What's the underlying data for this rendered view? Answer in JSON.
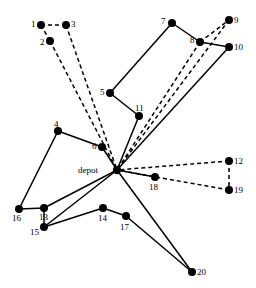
{
  "figure": {
    "kind": "vehicle-routing-network-diagram",
    "width": 256,
    "height": 288,
    "background_color": "#ffffff",
    "edge_color": "#000000",
    "node_color": "#000000",
    "label_color": "#000000"
  },
  "depot": {
    "id": "depot",
    "label": "depot",
    "x": 117,
    "y": 170,
    "radius": 4.2,
    "label_x": 78,
    "label_y": 166
  },
  "nodes": [
    {
      "id": 1,
      "label": "1",
      "x": 41,
      "y": 25,
      "label_x": 31,
      "label_y": 20
    },
    {
      "id": 2,
      "label": "2",
      "x": 50,
      "y": 41,
      "label_x": 40,
      "label_y": 38
    },
    {
      "id": 3,
      "label": "3",
      "x": 66,
      "y": 25,
      "label_x": 71,
      "label_y": 20
    },
    {
      "id": 4,
      "label": "4",
      "x": 58,
      "y": 131,
      "label_x": 54,
      "label_y": 120
    },
    {
      "id": 5,
      "label": "5",
      "x": 110,
      "y": 93,
      "label_x": 100,
      "label_y": 88
    },
    {
      "id": 6,
      "label": "6",
      "x": 102,
      "y": 147,
      "label_x": 92,
      "label_y": 142
    },
    {
      "id": 7,
      "label": "7",
      "x": 172,
      "y": 23,
      "label_x": 161,
      "label_y": 17
    },
    {
      "id": 8,
      "label": "8",
      "x": 200,
      "y": 42,
      "label_x": 190,
      "label_y": 36
    },
    {
      "id": 9,
      "label": "9",
      "x": 229,
      "y": 20,
      "label_x": 234,
      "label_y": 16
    },
    {
      "id": 10,
      "label": "10",
      "x": 229,
      "y": 47,
      "label_x": 234,
      "label_y": 43
    },
    {
      "id": 11,
      "label": "11",
      "x": 139,
      "y": 116,
      "label_x": 135,
      "label_y": 104
    },
    {
      "id": 12,
      "label": "12",
      "x": 229,
      "y": 161,
      "label_x": 234,
      "label_y": 157
    },
    {
      "id": 13,
      "label": "13",
      "x": 44,
      "y": 208,
      "label_x": 39,
      "label_y": 213
    },
    {
      "id": 14,
      "label": "14",
      "x": 103,
      "y": 208,
      "label_x": 98,
      "label_y": 214
    },
    {
      "id": 15,
      "label": "15",
      "x": 44,
      "y": 227,
      "label_x": 30,
      "label_y": 228
    },
    {
      "id": 16,
      "label": "16",
      "x": 19,
      "y": 209,
      "label_x": 12,
      "label_y": 214
    },
    {
      "id": 17,
      "label": "17",
      "x": 126,
      "y": 216,
      "label_x": 120,
      "label_y": 223
    },
    {
      "id": 18,
      "label": "18",
      "x": 155,
      "y": 177,
      "label_x": 149,
      "label_y": 183
    },
    {
      "id": 19,
      "label": "19",
      "x": 229,
      "y": 190,
      "label_x": 234,
      "label_y": 186
    },
    {
      "id": 20,
      "label": "20",
      "x": 192,
      "y": 272,
      "label_x": 197,
      "label_y": 268
    }
  ],
  "edges_solid": [
    {
      "from": "5",
      "to": "7"
    },
    {
      "from": "7",
      "to": "8"
    },
    {
      "from": "8",
      "to": "10"
    },
    {
      "from": "5",
      "to": "11"
    },
    {
      "from": "11",
      "to": "depot"
    },
    {
      "from": "10",
      "to": "depot"
    },
    {
      "from": "4",
      "to": "6"
    },
    {
      "from": "6",
      "to": "depot"
    },
    {
      "from": "4",
      "to": "16"
    },
    {
      "from": "16",
      "to": "13"
    },
    {
      "from": "13",
      "to": "depot"
    },
    {
      "from": "13",
      "to": "15"
    },
    {
      "from": "15",
      "to": "depot"
    },
    {
      "from": "15",
      "to": "14"
    },
    {
      "from": "14",
      "to": "17"
    },
    {
      "from": "17",
      "to": "20"
    },
    {
      "from": "20",
      "to": "depot"
    },
    {
      "from": "18",
      "to": "depot"
    }
  ],
  "edges_dashed": [
    {
      "from": "1",
      "to": "3"
    },
    {
      "from": "1",
      "to": "2"
    },
    {
      "from": "2",
      "to": "depot"
    },
    {
      "from": "3",
      "to": "depot"
    },
    {
      "from": "8",
      "to": "9"
    },
    {
      "from": "9",
      "to": "depot"
    },
    {
      "from": "8",
      "to": "depot"
    },
    {
      "from": "12",
      "to": "depot"
    },
    {
      "from": "12",
      "to": "19"
    },
    {
      "from": "19",
      "to": "depot"
    }
  ]
}
